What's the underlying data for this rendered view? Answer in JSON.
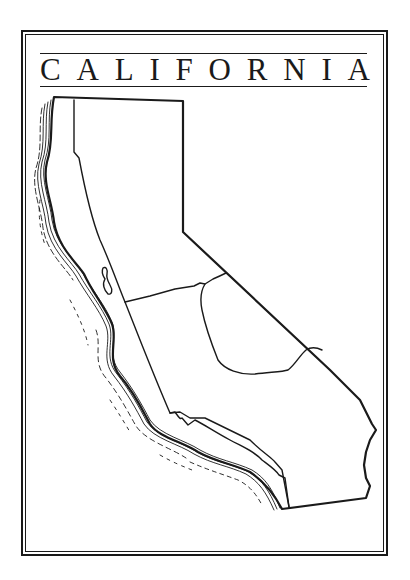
{
  "map": {
    "title": "CALIFORNIA",
    "title_letters": [
      "C",
      "A",
      "L",
      "I",
      "F",
      "O",
      "R",
      "N",
      "I",
      "A"
    ],
    "regions": [
      "north-coast",
      "northern-interior",
      "central-valley",
      "sierra-east",
      "mojave",
      "central-coast",
      "southern-california"
    ],
    "colors": {
      "ink": "#1a1a1a",
      "background": "#ffffff"
    }
  }
}
